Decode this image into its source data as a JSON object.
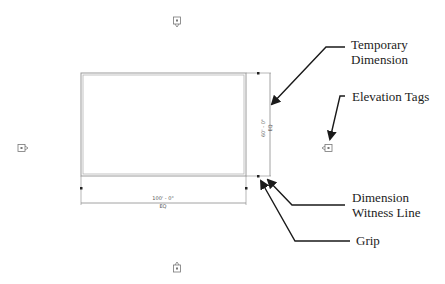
{
  "callouts": {
    "temporary_dimension": [
      "Temporary",
      "Dimension"
    ],
    "elevation_tags": "Elevation Tags",
    "dimension_witness_line": [
      "Dimension",
      "Witness Line"
    ],
    "grip": "Grip"
  },
  "dimensions": {
    "horizontal_value": "100' - 0\"",
    "horizontal_eq": "EQ",
    "vertical_value": "60' - 0\"",
    "vertical_eq": "EQ"
  },
  "elevation_tags": [
    {
      "position": "top",
      "icon": "elevation-tag-icon"
    },
    {
      "position": "left",
      "icon": "elevation-tag-icon"
    },
    {
      "position": "right",
      "icon": "elevation-tag-icon"
    },
    {
      "position": "bottom",
      "icon": "elevation-tag-icon"
    }
  ],
  "colors": {
    "wall": "#9a9a9a",
    "dimension_line": "#8a8a8a",
    "grip": "#222222",
    "arrow": "#1a1a1a",
    "tag": "#777777"
  }
}
